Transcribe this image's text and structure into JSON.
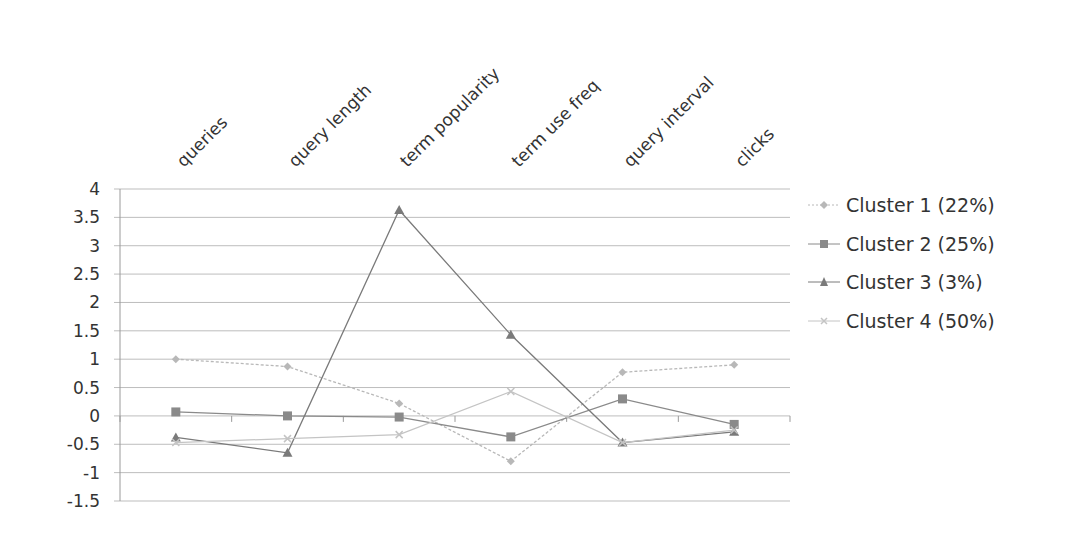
{
  "chart_data": {
    "type": "line",
    "title": "",
    "xlabel": "",
    "ylabel": "",
    "categories": [
      "queries",
      "query length",
      "term popularity",
      "term use freq",
      "query interval",
      "clicks"
    ],
    "y_ticks": [
      "4",
      "3.5",
      "3",
      "2.5",
      "2",
      "1.5",
      "1",
      "0.5",
      "0",
      "-0.5",
      "-1",
      "-1.5"
    ],
    "ylim": [
      -1.5,
      4
    ],
    "grid": true,
    "legend_position": "right",
    "series": [
      {
        "name": "Cluster 1 (22%)",
        "marker": "diamond",
        "values": [
          1.0,
          0.87,
          0.22,
          -0.8,
          0.77,
          0.9
        ]
      },
      {
        "name": "Cluster 2 (25%)",
        "marker": "square",
        "values": [
          0.07,
          0.0,
          -0.02,
          -0.37,
          0.3,
          -0.15
        ]
      },
      {
        "name": "Cluster 3 (3%)",
        "marker": "triangle",
        "values": [
          -0.38,
          -0.65,
          3.63,
          1.43,
          -0.47,
          -0.28
        ]
      },
      {
        "name": "Cluster 4 (50%)",
        "marker": "x",
        "values": [
          -0.47,
          -0.4,
          -0.33,
          0.43,
          -0.47,
          -0.25
        ]
      }
    ]
  },
  "legend": {
    "items": [
      {
        "label": "Cluster 1 (22%)",
        "color": "#b8b8b8"
      },
      {
        "label": "Cluster 2 (25%)",
        "color": "#8a8a8a"
      },
      {
        "label": "Cluster 3 (3%)",
        "color": "#7a7a7a"
      },
      {
        "label": "Cluster 4 (50%)",
        "color": "#c4c4c4"
      }
    ]
  },
  "colors": {
    "grid": "#bdbdbd",
    "axis": "#9a9a9a",
    "series": [
      "#b8b8b8",
      "#8a8a8a",
      "#7a7a7a",
      "#c4c4c4"
    ]
  }
}
